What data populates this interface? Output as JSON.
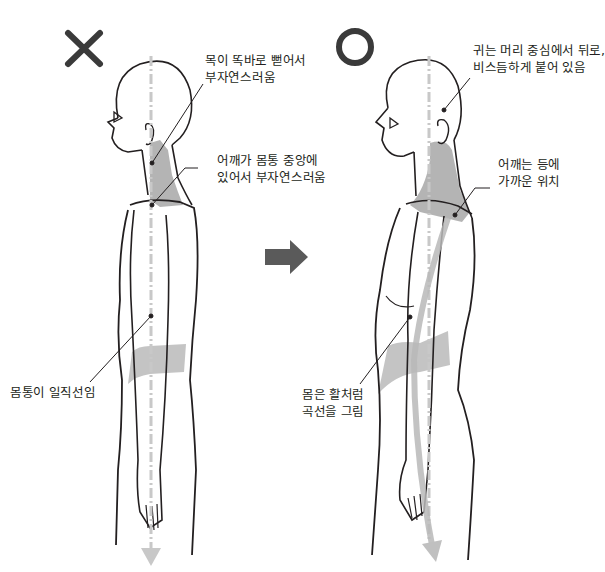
{
  "diagram": {
    "type": "posture-comparison",
    "bad_example": {
      "mark": "X",
      "mark_icon": "cross-icon",
      "annotations": [
        {
          "id": "neck",
          "lines": [
            "목이 똑바로 뻗어서",
            "부자연스러움"
          ]
        },
        {
          "id": "shoulder",
          "lines": [
            "어깨가 몸통 중앙에",
            "있어서 부자연스러움"
          ]
        },
        {
          "id": "torso",
          "lines": [
            "몸통이 일직선임"
          ]
        }
      ]
    },
    "good_example": {
      "mark": "O",
      "mark_icon": "circle-icon",
      "annotations": [
        {
          "id": "ear",
          "lines": [
            "귀는 머리 중심에서 뒤로,",
            "비스듬하게 붙어 있음"
          ]
        },
        {
          "id": "shoulder",
          "lines": [
            "어깨는 등에",
            "가까운 위치"
          ]
        },
        {
          "id": "torso",
          "lines": [
            "몸은 활처럼",
            "곡선을 그림"
          ]
        }
      ]
    },
    "transition_arrow": "right-arrow-icon",
    "colors": {
      "ink": "#231f20",
      "mark": "#3a3a3a",
      "highlight": "#a7a7a7",
      "guide": "#c8c8c8",
      "arrow": "#5a5a5a"
    }
  }
}
